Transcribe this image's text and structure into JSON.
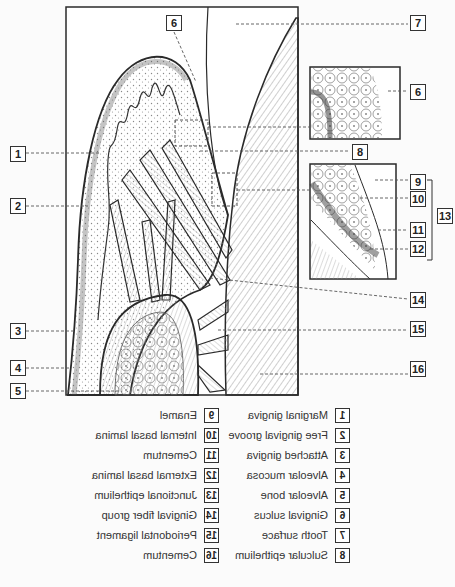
{
  "figure": {
    "callouts": [
      {
        "id": "c1",
        "num": "1",
        "x": 10,
        "y": 146
      },
      {
        "id": "c2",
        "num": "2",
        "x": 10,
        "y": 198
      },
      {
        "id": "c3",
        "num": "3",
        "x": 10,
        "y": 323
      },
      {
        "id": "c4",
        "num": "4",
        "x": 10,
        "y": 360
      },
      {
        "id": "c5",
        "num": "5",
        "x": 10,
        "y": 383
      },
      {
        "id": "c6a",
        "num": "6",
        "x": 166,
        "y": 15
      },
      {
        "id": "c7",
        "num": "7",
        "x": 410,
        "y": 15
      },
      {
        "id": "c6b",
        "num": "6",
        "x": 410,
        "y": 84
      },
      {
        "id": "c8",
        "num": "8",
        "x": 352,
        "y": 144
      },
      {
        "id": "c9",
        "num": "9",
        "x": 410,
        "y": 174
      },
      {
        "id": "c10",
        "num": "10",
        "x": 410,
        "y": 191
      },
      {
        "id": "c11",
        "num": "11",
        "x": 410,
        "y": 222
      },
      {
        "id": "c12",
        "num": "12",
        "x": 410,
        "y": 241
      },
      {
        "id": "c13",
        "num": "13",
        "x": 437,
        "y": 208
      },
      {
        "id": "c14",
        "num": "14",
        "x": 410,
        "y": 292
      },
      {
        "id": "c15",
        "num": "15",
        "x": 410,
        "y": 321
      },
      {
        "id": "c16",
        "num": "16",
        "x": 410,
        "y": 361
      }
    ]
  },
  "legend": {
    "note": "Legend rendered mirrored (horizontally flipped) in source image",
    "left_column": [
      {
        "num": "1",
        "label": "Marginal gingiva"
      },
      {
        "num": "2",
        "label": "Free gingival groove"
      },
      {
        "num": "3",
        "label": "Attached gingiva"
      },
      {
        "num": "4",
        "label": "Alveolar mucosa"
      },
      {
        "num": "5",
        "label": "Alveolar bone"
      },
      {
        "num": "6",
        "label": "Gingival sulcus"
      },
      {
        "num": "7",
        "label": "Tooth surface"
      },
      {
        "num": "8",
        "label": "Sulcular epithelium"
      }
    ],
    "right_column": [
      {
        "num": "9",
        "label": "Enamel"
      },
      {
        "num": "10",
        "label": "Internal basal lamina"
      },
      {
        "num": "11",
        "label": "Cementum"
      },
      {
        "num": "12",
        "label": "External basal lamina"
      },
      {
        "num": "13",
        "label": "Junctional epithelium"
      },
      {
        "num": "14",
        "label": "Gingival fiber group"
      },
      {
        "num": "15",
        "label": "Periodontal ligament"
      },
      {
        "num": "16",
        "label": "Cementum"
      }
    ]
  },
  "colors": {
    "line": "#2a2a2a",
    "dash": "#555555",
    "background": "#fbfbfb",
    "stipple": "#8a8a8a"
  }
}
